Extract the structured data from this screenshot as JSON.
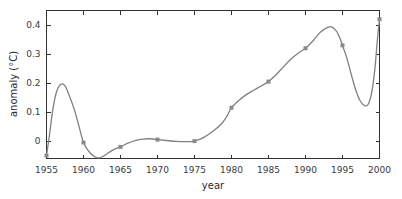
{
  "chart_data": {
    "type": "line",
    "title": "",
    "xlabel": "year",
    "ylabel": "anomaly (°C)",
    "xlim": [
      1955,
      2000
    ],
    "ylim": [
      -0.06,
      0.45
    ],
    "grid": false,
    "legend": "none",
    "line_color": "#808080",
    "marker_color": "#8a8a8a",
    "axis_color": "#333333",
    "xticks": [
      1955,
      1960,
      1965,
      1970,
      1975,
      1980,
      1985,
      1990,
      1995,
      2000
    ],
    "xtick_labels": [
      "1955",
      "1960",
      "1965",
      "1970",
      "1975",
      "1980",
      "1985",
      "1990",
      "1995",
      "2000"
    ],
    "yticks": [
      0,
      0.1,
      0.2,
      0.3,
      0.4
    ],
    "ytick_labels": [
      "0",
      "0.1",
      "0.2",
      "0.3",
      "0.4"
    ],
    "x": [
      1955,
      1960,
      1965,
      1970,
      1975,
      1980,
      1985,
      1990,
      1995,
      2000
    ],
    "values": [
      -0.05,
      -0.005,
      -0.02,
      0.005,
      0.0,
      0.115,
      0.205,
      0.32,
      0.33,
      0.42
    ],
    "curve_points": [
      [
        1955.0,
        -0.05
      ],
      [
        1955.4,
        0.02
      ],
      [
        1955.8,
        0.1
      ],
      [
        1956.3,
        0.165
      ],
      [
        1956.9,
        0.195
      ],
      [
        1957.5,
        0.19
      ],
      [
        1958.1,
        0.155
      ],
      [
        1958.8,
        0.105
      ],
      [
        1959.4,
        0.05
      ],
      [
        1960.0,
        -0.005
      ],
      [
        1960.7,
        -0.035
      ],
      [
        1961.4,
        -0.052
      ],
      [
        1962.1,
        -0.058
      ],
      [
        1962.8,
        -0.05
      ],
      [
        1963.5,
        -0.038
      ],
      [
        1964.2,
        -0.028
      ],
      [
        1965.0,
        -0.02
      ],
      [
        1966.0,
        -0.007
      ],
      [
        1967.0,
        0.002
      ],
      [
        1968.0,
        0.007
      ],
      [
        1969.0,
        0.008
      ],
      [
        1970.0,
        0.005
      ],
      [
        1971.2,
        0.002
      ],
      [
        1972.5,
        -0.001
      ],
      [
        1973.8,
        -0.002
      ],
      [
        1975.0,
        0.0
      ],
      [
        1976.2,
        0.012
      ],
      [
        1977.4,
        0.032
      ],
      [
        1978.6,
        0.058
      ],
      [
        1979.3,
        0.082
      ],
      [
        1980.0,
        0.115
      ],
      [
        1981.0,
        0.14
      ],
      [
        1982.0,
        0.16
      ],
      [
        1983.0,
        0.175
      ],
      [
        1984.0,
        0.19
      ],
      [
        1985.0,
        0.205
      ],
      [
        1986.0,
        0.228
      ],
      [
        1987.0,
        0.255
      ],
      [
        1988.0,
        0.282
      ],
      [
        1989.0,
        0.303
      ],
      [
        1990.0,
        0.32
      ],
      [
        1991.0,
        0.345
      ],
      [
        1992.0,
        0.375
      ],
      [
        1993.0,
        0.392
      ],
      [
        1993.6,
        0.393
      ],
      [
        1994.2,
        0.378
      ],
      [
        1994.7,
        0.352
      ],
      [
        1995.0,
        0.33
      ],
      [
        1995.6,
        0.285
      ],
      [
        1996.2,
        0.228
      ],
      [
        1996.8,
        0.175
      ],
      [
        1997.4,
        0.138
      ],
      [
        1998.0,
        0.122
      ],
      [
        1998.5,
        0.128
      ],
      [
        1999.0,
        0.175
      ],
      [
        1999.4,
        0.255
      ],
      [
        1999.7,
        0.345
      ],
      [
        2000.0,
        0.42
      ]
    ],
    "markers": [
      [
        1955,
        -0.05
      ],
      [
        1960,
        -0.005
      ],
      [
        1965,
        -0.02
      ],
      [
        1970,
        0.005
      ],
      [
        1975,
        0.0
      ],
      [
        1980,
        0.115
      ],
      [
        1985,
        0.205
      ],
      [
        1990,
        0.32
      ],
      [
        1995,
        0.33
      ],
      [
        2000,
        0.42
      ]
    ]
  }
}
